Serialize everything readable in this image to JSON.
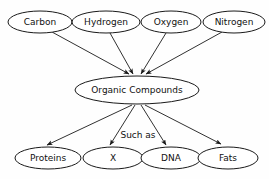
{
  "diagram": {
    "background_color": "#fefefe",
    "stroke_color": "#1a1a1a",
    "text_color": "#111111",
    "edge_label": "Such as",
    "sources": [
      {
        "id": "carbon",
        "label": "Carbon",
        "cx": 40,
        "cy": 22,
        "rx": 32,
        "ry": 11
      },
      {
        "id": "hydrogen",
        "label": "Hydrogen",
        "cx": 106,
        "cy": 22,
        "rx": 34,
        "ry": 11
      },
      {
        "id": "oxygen",
        "label": "Oxygen",
        "cx": 171,
        "cy": 22,
        "rx": 30,
        "ry": 11
      },
      {
        "id": "nitrogen",
        "label": "Nitrogen",
        "cx": 234,
        "cy": 22,
        "rx": 31,
        "ry": 11
      }
    ],
    "center": {
      "id": "organic-compounds",
      "label": "Organic Compounds",
      "cx": 137,
      "cy": 90,
      "rx": 62,
      "ry": 14
    },
    "products": [
      {
        "id": "proteins",
        "label": "Proteins",
        "cx": 48,
        "cy": 158,
        "rx": 33,
        "ry": 11
      },
      {
        "id": "x",
        "label": "X",
        "cx": 113,
        "cy": 158,
        "rx": 30,
        "ry": 11
      },
      {
        "id": "dna",
        "label": "DNA",
        "cx": 171,
        "cy": 158,
        "rx": 30,
        "ry": 11
      },
      {
        "id": "fats",
        "label": "Fats",
        "cx": 228,
        "cy": 158,
        "rx": 30,
        "ry": 11
      }
    ]
  }
}
